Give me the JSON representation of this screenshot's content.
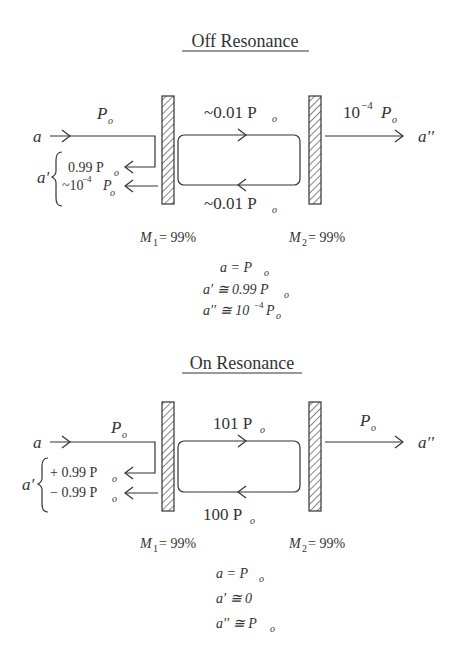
{
  "panels": [
    {
      "title": "Off Resonance",
      "input_label": "a",
      "input_power": "P",
      "intracavity_forward": "~0.01 P",
      "intracavity_backward": "~0.01 P",
      "output_power": "10",
      "output_power_exp": "−4",
      "output_label": "a′′",
      "reflected_label": "a′",
      "reflected_1": "0.99 P",
      "reflected_2_prefix": "~10",
      "reflected_2_exp": "−4",
      "mirror1": "M",
      "mirror1_sub": "1",
      "mirror1_value": "= 99%",
      "mirror2": "M",
      "mirror2_sub": "2",
      "mirror2_value": "= 99%",
      "eq1": "a = P",
      "eq2": "a′ ≅ 0.99 P",
      "eq3_prefix": "a′′ ≅ 10",
      "eq3_exp": "−4",
      "eq3_suffix": " P",
      "sub_o": "o"
    },
    {
      "title": "On Resonance",
      "input_label": "a",
      "input_power": "P",
      "intracavity_forward": "101 P",
      "intracavity_backward": "100 P",
      "output_power": "P",
      "output_label": "a′′",
      "reflected_label": "a′",
      "reflected_1": "+ 0.99 P",
      "reflected_2": "− 0.99 P",
      "mirror1": "M",
      "mirror1_sub": "1",
      "mirror1_value": "= 99%",
      "mirror2": "M",
      "mirror2_sub": "2",
      "mirror2_value": "= 99%",
      "eq1": "a = P",
      "eq2": "a′ ≅ 0",
      "eq3": "a′′ ≅  P",
      "sub_o": "o"
    }
  ]
}
